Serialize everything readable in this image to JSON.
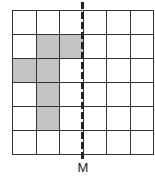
{
  "diagram": {
    "type": "grid-reflection",
    "rows": 6,
    "cols": 6,
    "shaded_cells": [
      [
        1,
        1
      ],
      [
        1,
        2
      ],
      [
        2,
        0
      ],
      [
        2,
        1
      ],
      [
        3,
        1
      ],
      [
        4,
        1
      ]
    ],
    "shaded_color": "#c4c4c4",
    "line_color": "#333333",
    "axis": {
      "label": "M",
      "style": "dashed",
      "position_col_boundary": 3
    }
  }
}
